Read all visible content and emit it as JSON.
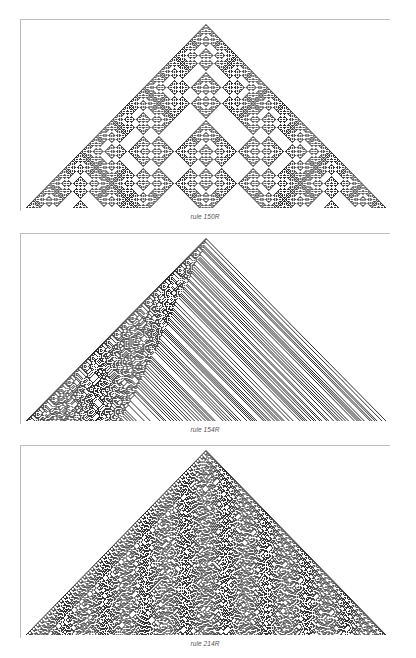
{
  "figures": [
    {
      "id": "panel-150",
      "caption": "rule 150R",
      "rule": 150,
      "frame": {
        "top": 19,
        "height": 192
      },
      "caption_top": 213,
      "style": "sierpinski-like nested fractal triangles"
    },
    {
      "id": "panel-154",
      "caption": "rule 154R",
      "rule": 154,
      "frame": {
        "top": 233,
        "height": 191
      },
      "caption_top": 426,
      "style": "random left region with diagonal stripes on right"
    },
    {
      "id": "panel-214",
      "caption": "rule 214R",
      "rule": 214,
      "frame": {
        "top": 445,
        "height": 193
      },
      "caption_top": 640,
      "style": "fully random triangle"
    }
  ],
  "colors": {
    "cell": "#2a2a2a",
    "frame": "#bdbdbd",
    "background": "#ffffff",
    "caption": "#555555"
  }
}
